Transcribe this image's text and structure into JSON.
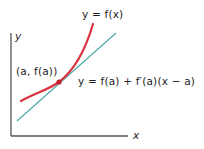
{
  "diagram": {
    "type": "tangent-line-illustration",
    "axes": {
      "x_label": "x",
      "y_label": "y",
      "color": "#555555"
    },
    "curve": {
      "label": "y = f(x)",
      "color": "#d9323e"
    },
    "tangent_line": {
      "label": "y = f(a) + f′(a)(x − a)",
      "color": "#4aa9a3"
    },
    "point": {
      "label": "(a, f(a))",
      "color": "#c4202c"
    }
  }
}
